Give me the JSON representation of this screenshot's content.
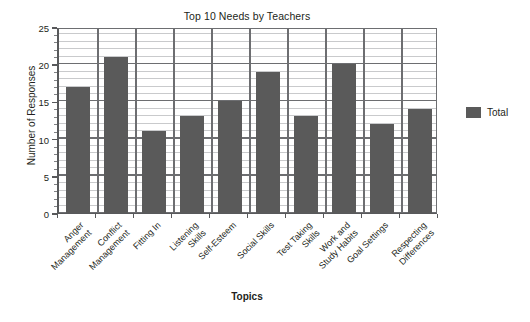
{
  "chart_data": {
    "type": "bar",
    "title": "Top 10 Needs by Teachers",
    "xlabel": "Topics",
    "ylabel": "Number of Responses",
    "categories": [
      "Anger Management",
      "Conflict Management",
      "Fitting In",
      "Listening Skills",
      "Self-Esteem",
      "Social Skills",
      "Test Taking Skills",
      "Work and Study Habits",
      "Goal Settings",
      "Respecting Differences"
    ],
    "category_lines": [
      [
        "Anger",
        "Management"
      ],
      [
        "Conflict",
        "Management"
      ],
      [
        "Fitting In"
      ],
      [
        "Listening",
        "Skills"
      ],
      [
        "Self-Esteem"
      ],
      [
        "Social Skills"
      ],
      [
        "Test Taking",
        "Skills"
      ],
      [
        "Work and",
        "Study Habits"
      ],
      [
        "Goal Settings"
      ],
      [
        "Respecting",
        "Differences"
      ]
    ],
    "series": [
      {
        "name": "Total",
        "values": [
          17,
          21,
          11,
          13,
          15,
          19,
          13,
          20,
          12,
          14
        ],
        "color": "#5a5a5a"
      }
    ],
    "values": [
      17,
      21,
      11,
      13,
      15,
      19,
      13,
      20,
      12,
      14
    ],
    "ylim": [
      0,
      25
    ],
    "ytick_values": [
      0,
      5,
      10,
      15,
      20,
      25
    ],
    "ytick_labels": [
      "0",
      "5",
      "10",
      "15",
      "20",
      "25"
    ],
    "y_minor_step": 1,
    "grid": "horizontal-major-and-minor, vertical-category-dividers",
    "legend_position": "right",
    "legend_entries": [
      "Total"
    ],
    "bar_color": "#5a5a5a",
    "gridline_major_color": "#6d6e71",
    "gridline_minor_color": "#c9cacc",
    "axis_color": "#58595b",
    "text_color": "#231f20",
    "background_color": "#ffffff",
    "xtick_label_rotation": -45
  },
  "legend": {
    "total_label": "Total"
  }
}
